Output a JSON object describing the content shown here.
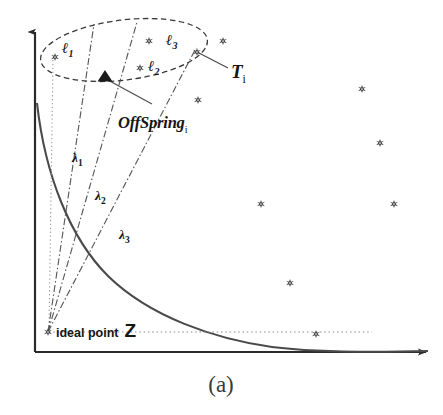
{
  "figure": {
    "caption": "(a)",
    "background_color": "#ffffff",
    "ink_color": "#2b2b2b"
  },
  "axes": {
    "y_axis": {
      "name": "vertical-objective-axis",
      "x": 35,
      "y_top": 26,
      "y_bottom": 352,
      "arrow": "up"
    },
    "x_axis": {
      "name": "horizontal-objective-axis",
      "y": 352,
      "x_left": 35,
      "x_right": 432,
      "arrow": "right"
    }
  },
  "ideal_point": {
    "label_prefix": "ideal point",
    "label_symbol": "Z",
    "x": 48,
    "y": 332
  },
  "pareto_front": {
    "name": "pareto-front-curve",
    "description": "convex decreasing curve",
    "start": [
      38,
      104
    ],
    "end": [
      430,
      350
    ]
  },
  "neighborhood_ellipse": {
    "label": "T",
    "label_subscript": "i",
    "center_x": 124,
    "center_y": 50,
    "radius_x": 84,
    "radius_y": 30,
    "rotation_deg": -7
  },
  "offspring": {
    "label": "OffSpring",
    "label_subscript": "i",
    "marker": "filled-triangle",
    "x": 105,
    "y": 78,
    "label_x": 118,
    "label_y": 125
  },
  "weight_vectors": [
    {
      "label": "λ",
      "subscript": "1",
      "label_x": 72,
      "label_y": 160,
      "end_x": 94,
      "end_y": 24
    },
    {
      "label": "λ",
      "subscript": "2",
      "label_x": 95,
      "label_y": 198,
      "end_x": 137,
      "end_y": 22
    },
    {
      "label": "λ",
      "subscript": "3",
      "label_x": 119,
      "label_y": 237,
      "end_x": 196,
      "end_y": 48
    }
  ],
  "subproblem_labels": [
    {
      "label": "ℓ",
      "subscript": "1",
      "x": 62,
      "y": 50
    },
    {
      "label": "ℓ",
      "subscript": "2",
      "x": 148,
      "y": 67
    },
    {
      "label": "ℓ",
      "subscript": "3",
      "x": 166,
      "y": 42
    }
  ],
  "solution_points": [
    {
      "name": "point-l1",
      "x": 55,
      "y": 57
    },
    {
      "name": "point-l2",
      "x": 140,
      "y": 68
    },
    {
      "name": "point-l3-inner",
      "x": 149,
      "y": 41
    },
    {
      "name": "point-ellipse-edge",
      "x": 197,
      "y": 52
    },
    {
      "name": "point-outer-top",
      "x": 223,
      "y": 41
    },
    {
      "name": "point-mid-left",
      "x": 198,
      "y": 100
    },
    {
      "name": "point-right-upper",
      "x": 362,
      "y": 89
    },
    {
      "name": "point-right-mid",
      "x": 380,
      "y": 143
    },
    {
      "name": "point-mid-lower",
      "x": 261,
      "y": 204
    },
    {
      "name": "point-far-right",
      "x": 394,
      "y": 204
    },
    {
      "name": "point-lower-mid",
      "x": 290,
      "y": 283
    },
    {
      "name": "point-on-baseline",
      "x": 316,
      "y": 334
    }
  ]
}
